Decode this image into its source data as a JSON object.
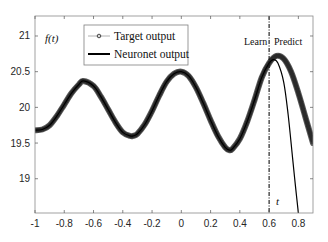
{
  "chart_data": {
    "type": "line",
    "title": "",
    "xlabel": "t",
    "ylabel": "f(t)",
    "xlim": [
      -1,
      0.9
    ],
    "ylim": [
      18.52,
      21.28
    ],
    "x_ticks": [
      -1,
      -0.8,
      -0.6,
      -0.4,
      -0.2,
      0,
      0.2,
      0.4,
      0.6,
      0.8
    ],
    "x_tick_labels": [
      "-1",
      "-0.8",
      "-0.6",
      "-0.4",
      "-0.2",
      "0",
      "0.2",
      "0.4",
      "0.6",
      "0.8"
    ],
    "y_ticks": [
      19,
      19.5,
      20,
      20.5,
      21
    ],
    "y_tick_labels": [
      "19",
      "19.5",
      "20",
      "20.5",
      "21"
    ],
    "grid": false,
    "legend_position": "upper-left-center",
    "legend": [
      "Target output",
      "Neuronet output"
    ],
    "annotations": [
      {
        "text": "Learn",
        "x": 0.47,
        "y": 21.03
      },
      {
        "text": "Predict",
        "x": 0.75,
        "y": 21.03
      },
      {
        "text": "f(t)",
        "x": -0.9,
        "y": 20.98
      },
      {
        "text": "t",
        "x": 0.69,
        "y": 18.68
      }
    ],
    "divider": {
      "x": 0.6,
      "style": "dash-dot",
      "label_left": "Learn",
      "label_right": "Predict"
    },
    "series": [
      {
        "name": "Target output",
        "style": "gray circle markers (dense, thick band)",
        "x": [
          -1,
          -0.95,
          -0.9,
          -0.85,
          -0.8,
          -0.75,
          -0.7,
          -0.67,
          -0.6,
          -0.55,
          -0.5,
          -0.45,
          -0.4,
          -0.35,
          -0.33,
          -0.3,
          -0.25,
          -0.2,
          -0.15,
          -0.1,
          -0.05,
          0,
          0.05,
          0.1,
          0.15,
          0.2,
          0.25,
          0.3,
          0.33,
          0.35,
          0.4,
          0.45,
          0.5,
          0.55,
          0.6,
          0.65,
          0.7,
          0.75,
          0.8,
          0.85,
          0.9
        ],
        "values": [
          19.68,
          19.69,
          19.75,
          19.88,
          20.04,
          20.2,
          20.32,
          20.37,
          20.3,
          20.15,
          19.97,
          19.79,
          19.65,
          19.6,
          19.6,
          19.63,
          19.76,
          19.95,
          20.17,
          20.36,
          20.47,
          20.5,
          20.44,
          20.28,
          20.06,
          19.82,
          19.6,
          19.44,
          19.4,
          19.42,
          19.56,
          19.8,
          20.1,
          20.42,
          20.62,
          20.72,
          20.68,
          20.5,
          20.2,
          19.85,
          19.5
        ]
      },
      {
        "name": "Neuronet output",
        "style": "solid black line",
        "x": [
          -1,
          -0.95,
          -0.9,
          -0.85,
          -0.8,
          -0.75,
          -0.7,
          -0.67,
          -0.6,
          -0.55,
          -0.5,
          -0.45,
          -0.4,
          -0.35,
          -0.33,
          -0.3,
          -0.25,
          -0.2,
          -0.15,
          -0.1,
          -0.05,
          0,
          0.05,
          0.1,
          0.15,
          0.2,
          0.25,
          0.3,
          0.33,
          0.35,
          0.4,
          0.45,
          0.5,
          0.55,
          0.6,
          0.63,
          0.66,
          0.7,
          0.73,
          0.76,
          0.78,
          0.8
        ],
        "values": [
          19.68,
          19.69,
          19.75,
          19.88,
          20.04,
          20.2,
          20.32,
          20.37,
          20.3,
          20.15,
          19.97,
          19.79,
          19.65,
          19.6,
          19.6,
          19.63,
          19.76,
          19.95,
          20.17,
          20.36,
          20.47,
          20.5,
          20.44,
          20.28,
          20.06,
          19.82,
          19.6,
          19.44,
          19.4,
          19.42,
          19.56,
          19.8,
          20.1,
          20.42,
          20.62,
          20.67,
          20.62,
          20.35,
          19.9,
          19.3,
          18.9,
          18.52
        ]
      }
    ]
  },
  "legend": {
    "target_label": "Target output",
    "neuronet_label": "Neuronet output"
  },
  "annotations": {
    "learn": "Learn",
    "predict": "Predict",
    "ylabel": "f(t)",
    "xlabel": "t"
  },
  "colors": {
    "target": "#3a3a3a",
    "neuronet": "#000000",
    "axis": "#7f7f7f",
    "text": "#262626"
  }
}
